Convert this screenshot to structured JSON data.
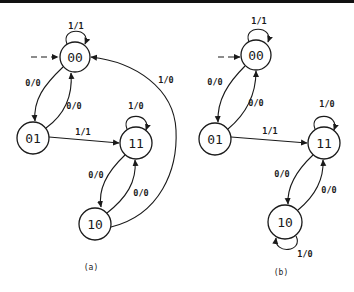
{
  "colors": {
    "ink": "#1a1a1a",
    "background": "#ffffff"
  },
  "diagrams": [
    {
      "caption": "(a)",
      "caption_pos": [
        91,
        267
      ],
      "initial_state": "00",
      "states": [
        {
          "id": "00",
          "label": "00",
          "cx": 75,
          "cy": 57,
          "r": 15
        },
        {
          "id": "01",
          "label": "01",
          "cx": 33,
          "cy": 138,
          "r": 16
        },
        {
          "id": "11",
          "label": "11",
          "cx": 136,
          "cy": 143,
          "r": 16
        },
        {
          "id": "10",
          "label": "10",
          "cx": 95,
          "cy": 224,
          "r": 16
        }
      ],
      "transitions": [
        {
          "from": "00",
          "to": "00",
          "label": "1/1"
        },
        {
          "from": "00",
          "to": "01",
          "label": "0/0"
        },
        {
          "from": "01",
          "to": "00",
          "label": "0/0"
        },
        {
          "from": "01",
          "to": "11",
          "label": "1/1"
        },
        {
          "from": "11",
          "to": "11",
          "label": "1/0"
        },
        {
          "from": "11",
          "to": "10",
          "label": "0/0"
        },
        {
          "from": "10",
          "to": "11",
          "label": "0/0"
        },
        {
          "from": "10",
          "to": "00",
          "label": "1/0"
        }
      ]
    },
    {
      "caption": "(b)",
      "caption_pos": [
        281,
        272
      ],
      "initial_state": "00",
      "states": [
        {
          "id": "00",
          "label": "00",
          "cx": 256,
          "cy": 55,
          "r": 15
        },
        {
          "id": "01",
          "label": "01",
          "cx": 215,
          "cy": 139,
          "r": 16
        },
        {
          "id": "11",
          "label": "11",
          "cx": 324,
          "cy": 143,
          "r": 16
        },
        {
          "id": "10",
          "label": "10",
          "cx": 285,
          "cy": 222,
          "r": 17
        }
      ],
      "transitions": [
        {
          "from": "00",
          "to": "00",
          "label": "1/1"
        },
        {
          "from": "00",
          "to": "01",
          "label": "0/0"
        },
        {
          "from": "01",
          "to": "00",
          "label": "0/0"
        },
        {
          "from": "01",
          "to": "11",
          "label": "1/1"
        },
        {
          "from": "11",
          "to": "11",
          "label": "1/0"
        },
        {
          "from": "11",
          "to": "10",
          "label": "0/0"
        },
        {
          "from": "10",
          "to": "11",
          "label": "0/0"
        },
        {
          "from": "10",
          "to": "10",
          "label": "1/0"
        }
      ]
    }
  ]
}
